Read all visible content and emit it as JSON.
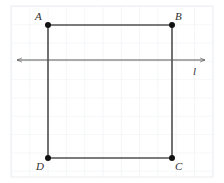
{
  "figure": {
    "type": "geometry-diagram",
    "width": 224,
    "height": 183,
    "background_color": "#ffffff"
  },
  "grid": {
    "line_color": "#edeff3",
    "spacing": 18.3,
    "left": 11,
    "top": 6,
    "right": 213,
    "bottom": 177,
    "columns": 11,
    "rows": 9,
    "visible": true
  },
  "shape": {
    "name": "square-abcd",
    "stroke_color": "#4f4f4f",
    "stroke_width": 1.6,
    "fill": "none",
    "vertex_dot_color": "#111111",
    "vertex_dot_radius": 3,
    "vertices": [
      {
        "id": "A",
        "label": "A",
        "x": 48,
        "y": 25,
        "label_x": 35,
        "label_y": 11
      },
      {
        "id": "B",
        "label": "B",
        "x": 172,
        "y": 25,
        "label_x": 175,
        "label_y": 11
      },
      {
        "id": "C",
        "label": "C",
        "x": 172,
        "y": 158,
        "label_x": 175,
        "label_y": 161
      },
      {
        "id": "D",
        "label": "D",
        "x": 48,
        "y": 158,
        "label_x": 36,
        "label_y": 161
      }
    ],
    "edges": [
      {
        "id": "AB",
        "from": "A",
        "to": "B"
      },
      {
        "id": "BC",
        "from": "B",
        "to": "C"
      },
      {
        "id": "CD",
        "from": "C",
        "to": "D"
      },
      {
        "id": "DA",
        "from": "D",
        "to": "A"
      }
    ]
  },
  "line": {
    "id": "line-l",
    "label": "l",
    "stroke_color": "#545454",
    "stroke_width": 1.0,
    "y": 60,
    "x_start": 14,
    "x_end": 208,
    "arrow_start": true,
    "arrow_end": true,
    "label_x": 193,
    "label_y": 66
  }
}
